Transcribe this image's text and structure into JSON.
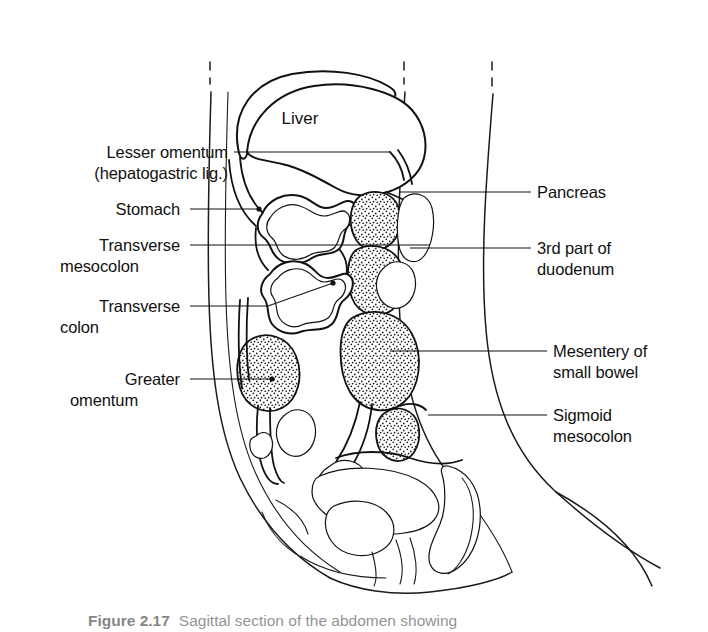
{
  "figure": {
    "organ_labels": [
      {
        "id": "liver",
        "text": "Liver",
        "x": 300,
        "y": 124
      }
    ],
    "left_labels": [
      {
        "id": "lesser-omentum",
        "lines": [
          "Lesser omentum",
          "(hepatogastric lig.)"
        ],
        "text_x": 228,
        "line1_y": 158,
        "line2_y": 179,
        "leader_x1": 234,
        "leader_y1": 152,
        "leader_x2": 390,
        "leader_y2": 152,
        "dot": false
      },
      {
        "id": "stomach",
        "lines": [
          "Stomach"
        ],
        "text_x": 180,
        "line1_y": 215,
        "leader_x1": 190,
        "leader_y1": 209,
        "leader_x2": 259,
        "leader_y2": 209,
        "dot": true,
        "dot_x": 259,
        "dot_y": 209
      },
      {
        "id": "transverse-mesocolon",
        "lines": [
          "Transverse",
          "mesocolon"
        ],
        "text_x": 180,
        "line1_y": 251,
        "line2_y": 272,
        "leader_x1": 190,
        "leader_y1": 245,
        "leader_x2": 430,
        "leader_y2": 245,
        "dot": false
      },
      {
        "id": "transverse-colon",
        "lines": [
          "Transverse",
          "colon"
        ],
        "text_x": 180,
        "line1_y": 312,
        "line2_y": 333,
        "leader_x1": 190,
        "leader_y1": 306,
        "leader_x2": 268,
        "leader_y2": 306,
        "leader_x3": 333,
        "leader_y3": 283,
        "dot": true,
        "dot_x": 333,
        "dot_y": 283
      },
      {
        "id": "greater-omentum",
        "lines": [
          "Greater",
          "omentum"
        ],
        "text_x": 180,
        "line1_y": 385,
        "line2_y": 406,
        "leader_x1": 190,
        "leader_y1": 379,
        "leader_x2": 272,
        "leader_y2": 379,
        "dot": true,
        "dot_x": 272,
        "dot_y": 379
      }
    ],
    "right_labels": [
      {
        "id": "pancreas",
        "lines": [
          "Pancreas"
        ],
        "text_x": 537,
        "line1_y": 198,
        "leader_x1": 400,
        "leader_y1": 192,
        "leader_x2": 531,
        "leader_y2": 192,
        "dot": false
      },
      {
        "id": "duodenum-3rd-part",
        "lines": [
          "3rd part of",
          "duodenum"
        ],
        "text_x": 537,
        "line1_y": 254,
        "line2_y": 275,
        "leader_x1": 410,
        "leader_y1": 248,
        "leader_x2": 531,
        "leader_y2": 248,
        "dot": false
      },
      {
        "id": "mesentery-small-bowel",
        "lines": [
          "Mesentery of",
          "small bowel"
        ],
        "text_x": 553,
        "line1_y": 357,
        "line2_y": 378,
        "leader_x1": 390,
        "leader_y1": 351,
        "leader_x2": 547,
        "leader_y2": 351,
        "dot": false
      },
      {
        "id": "sigmoid-mesocolon",
        "lines": [
          "Sigmoid",
          "mesocolon"
        ],
        "text_x": 553,
        "line1_y": 421,
        "line2_y": 442,
        "leader_x1": 428,
        "leader_y1": 415,
        "leader_x2": 547,
        "leader_y2": 415,
        "dot": false
      }
    ],
    "caption": {
      "number": "Figure 2.17",
      "text": "Sagittal section of the abdomen showing"
    },
    "colors": {
      "ink": "#111111",
      "background": "#ffffff",
      "stipple": "#1a1a1a"
    }
  }
}
